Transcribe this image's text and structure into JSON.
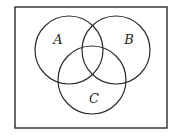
{
  "diagram": {
    "type": "venn",
    "universe_frame": {
      "x": 15,
      "y": 7,
      "width": 152,
      "height": 121
    },
    "stroke_color": "#2a2a2a",
    "sets": [
      {
        "id": "A",
        "label": "A",
        "cx": 69,
        "cy": 50,
        "r": 34,
        "label_x": 58,
        "label_y": 44
      },
      {
        "id": "B",
        "label": "B",
        "cx": 116,
        "cy": 50,
        "r": 34,
        "label_x": 129,
        "label_y": 44
      },
      {
        "id": "C",
        "label": "C",
        "cx": 92,
        "cy": 80,
        "r": 34,
        "label_x": 94,
        "label_y": 103
      }
    ]
  }
}
